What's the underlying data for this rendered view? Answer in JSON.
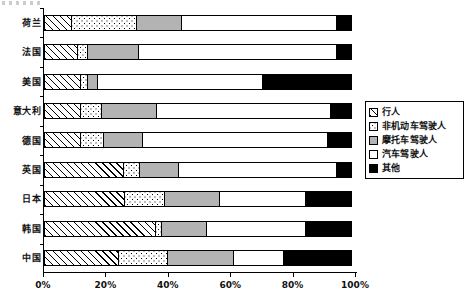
{
  "chart_data": {
    "type": "bar",
    "orientation": "horizontal",
    "stacked": true,
    "normalized": true,
    "title": "",
    "xlabel": "",
    "ylabel": "",
    "xlim": [
      0,
      100
    ],
    "xticks": [
      "0%",
      "20%",
      "40%",
      "60%",
      "80%",
      "100%"
    ],
    "xtick_values": [
      0,
      20,
      40,
      60,
      80,
      100
    ],
    "grid": false,
    "legend_position": "right",
    "categories": [
      "荷兰",
      "法国",
      "美国",
      "意大利",
      "德国",
      "英国",
      "日本",
      "韩国",
      "中国"
    ],
    "series": [
      {
        "name": "行人",
        "pattern": "diagonal-hatch",
        "values": [
          9,
          11,
          12,
          12,
          12,
          25.5,
          26,
          36,
          24
        ]
      },
      {
        "name": "非机动车驾驶人",
        "pattern": "dotted",
        "values": [
          21,
          3.5,
          2.5,
          7,
          7.5,
          5.5,
          13,
          2,
          16
        ]
      },
      {
        "name": "摩托车驾驶人",
        "pattern": "solid-gray",
        "values": [
          15,
          16.5,
          3.5,
          18,
          13,
          13,
          18,
          15,
          21.5
        ]
      },
      {
        "name": "汽车驾驶人",
        "pattern": "solid-white",
        "values": [
          50,
          64,
          53,
          56,
          59.5,
          51,
          28,
          32,
          16.5
        ]
      },
      {
        "name": "其他",
        "pattern": "solid-black",
        "values": [
          5,
          5,
          29,
          7,
          8,
          5,
          15,
          15,
          22
        ]
      }
    ]
  },
  "legend": {
    "items": [
      {
        "label": "行人",
        "pattern": "diagonal-hatch"
      },
      {
        "label": "非机动车驾驶人",
        "pattern": "dotted"
      },
      {
        "label": "摩托车驾驶人",
        "pattern": "solid-gray"
      },
      {
        "label": "汽车驾驶人",
        "pattern": "solid-white"
      },
      {
        "label": "其他",
        "pattern": "solid-black"
      }
    ]
  },
  "colors": {
    "hatch": "#000000",
    "dots": "#000000",
    "gray": "#b3b3b3",
    "white": "#ffffff",
    "black": "#000000",
    "axis": "#000000",
    "text": "#111111"
  }
}
